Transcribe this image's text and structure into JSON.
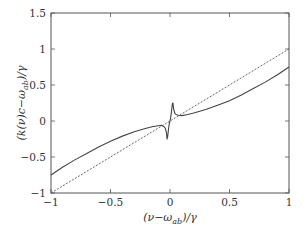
{
  "chart_data": {
    "type": "line",
    "title": "",
    "xlabel": "(ν−ω_ab)/γ",
    "ylabel": "(k(ν)c−ω_ab)/γ",
    "xlim": [
      -1,
      1
    ],
    "ylim": [
      -1,
      1.5
    ],
    "xticks": [
      -1,
      -0.5,
      0,
      0.5,
      1
    ],
    "xtick_labels": [
      "−1",
      "−0.5",
      "0",
      "0.5",
      "1"
    ],
    "yticks": [
      -1,
      -0.5,
      0,
      0.5,
      1,
      1.5
    ],
    "ytick_labels": [
      "−1",
      "−0.5",
      "0",
      "0.5",
      "1",
      "1.5"
    ],
    "grid": false,
    "legend": null,
    "series": [
      {
        "name": "dispersion k(ν)c",
        "style": "solid",
        "color": "#444444",
        "x": [
          -1,
          -0.9,
          -0.8,
          -0.7,
          -0.6,
          -0.5,
          -0.4,
          -0.3,
          -0.2,
          -0.15,
          -0.1,
          -0.07,
          -0.05,
          -0.04,
          -0.03,
          -0.025,
          -0.02,
          -0.015,
          -0.01,
          -0.005,
          0,
          0.005,
          0.01,
          0.015,
          0.02,
          0.025,
          0.03,
          0.04,
          0.05,
          0.07,
          0.1,
          0.15,
          0.2,
          0.3,
          0.4,
          0.5,
          0.6,
          0.7,
          0.8,
          0.9,
          1
        ],
        "values": [
          -0.75,
          -0.64,
          -0.54,
          -0.45,
          -0.36,
          -0.28,
          -0.21,
          -0.15,
          -0.1,
          -0.08,
          -0.065,
          -0.06,
          -0.08,
          -0.1,
          -0.16,
          -0.25,
          -0.22,
          -0.15,
          -0.08,
          -0.03,
          0,
          0.04,
          0.1,
          0.17,
          0.24,
          0.25,
          0.17,
          0.11,
          0.09,
          0.08,
          0.075,
          0.09,
          0.11,
          0.16,
          0.22,
          0.28,
          0.36,
          0.45,
          0.54,
          0.64,
          0.75
        ]
      },
      {
        "name": "vacuum line y = x",
        "style": "dashed",
        "color": "#555555",
        "x": [
          -1,
          1
        ],
        "values": [
          -1,
          1
        ]
      }
    ]
  },
  "plot_box": {
    "left": 51,
    "top": 13,
    "right": 289,
    "bottom": 193
  }
}
